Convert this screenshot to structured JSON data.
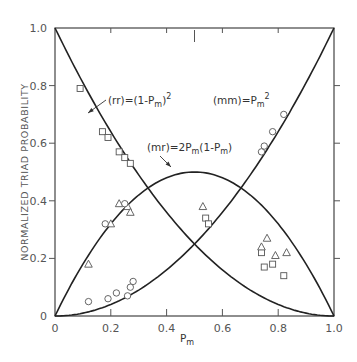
{
  "chart_data": {
    "type": "scatter",
    "title": "",
    "xlabel": "P_m",
    "ylabel": "NORMALIZED TRIAD PROBABILITY",
    "xlim": [
      0,
      1.0
    ],
    "ylim": [
      0,
      1.0
    ],
    "x_ticks": [
      "0",
      "0.2",
      "0.4",
      "0.6",
      "0.8",
      "1.0"
    ],
    "y_ticks": [
      "0",
      "0.2",
      "0.4",
      "0.6",
      "0.8",
      "1.0"
    ],
    "grid": false,
    "legend": "none (curves labeled by annotations)",
    "curves": [
      {
        "name": "(rr)",
        "formula": "(1-P_m)^2",
        "label_text": "(rr)=(1-Pm)2"
      },
      {
        "name": "(mm)",
        "formula": "P_m^2",
        "label_text": "(mm)=Pm2"
      },
      {
        "name": "(mr)",
        "formula": "2P_m(1-P_m)",
        "label_text": "(mr)=2Pm(1-Pm)"
      }
    ],
    "series": [
      {
        "name": "rr (squares)",
        "marker": "square",
        "points": [
          [
            0.09,
            0.79
          ],
          [
            0.17,
            0.64
          ],
          [
            0.19,
            0.62
          ],
          [
            0.23,
            0.57
          ],
          [
            0.25,
            0.55
          ],
          [
            0.27,
            0.53
          ],
          [
            0.54,
            0.34
          ],
          [
            0.55,
            0.32
          ],
          [
            0.74,
            0.22
          ],
          [
            0.75,
            0.17
          ],
          [
            0.78,
            0.18
          ],
          [
            0.82,
            0.14
          ]
        ]
      },
      {
        "name": "mr (triangles)",
        "marker": "triangle",
        "points": [
          [
            0.12,
            0.18
          ],
          [
            0.2,
            0.32
          ],
          [
            0.23,
            0.39
          ],
          [
            0.26,
            0.38
          ],
          [
            0.27,
            0.36
          ],
          [
            0.53,
            0.38
          ],
          [
            0.74,
            0.24
          ],
          [
            0.76,
            0.27
          ],
          [
            0.79,
            0.21
          ],
          [
            0.83,
            0.22
          ]
        ]
      },
      {
        "name": "mm (circles)",
        "marker": "circle",
        "points": [
          [
            0.12,
            0.05
          ],
          [
            0.19,
            0.06
          ],
          [
            0.22,
            0.08
          ],
          [
            0.26,
            0.07
          ],
          [
            0.27,
            0.1
          ],
          [
            0.28,
            0.12
          ],
          [
            0.18,
            0.32
          ],
          [
            0.25,
            0.39
          ],
          [
            0.74,
            0.57
          ],
          [
            0.75,
            0.59
          ],
          [
            0.78,
            0.64
          ],
          [
            0.82,
            0.7
          ]
        ]
      }
    ]
  },
  "labels": {
    "y_axis": "NORMALIZED TRIAD PROBABILITY",
    "x_axis_main": "P",
    "x_axis_sub": "m",
    "rr_main": "(rr)=(1-P",
    "rr_sub": "m",
    "rr_end": ")",
    "rr_sup": "2",
    "mm_main": "(mm)=P",
    "mm_sub": "m",
    "mm_sup": "2",
    "mr_main": "(mr)=2P",
    "mr_sub1": "m",
    "mr_mid": "(1-P",
    "mr_sub2": "m",
    "mr_end": ")"
  }
}
